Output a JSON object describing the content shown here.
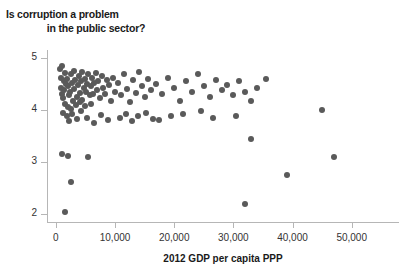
{
  "chart_data": {
    "type": "scatter",
    "title": "Is corruption a problem in the public sector?",
    "title_line1": "Is corruption a problem",
    "title_line2": "in the public sector?",
    "xlabel": "2012 GDP per capita PPP",
    "ylabel": "",
    "xlim": [
      -1500,
      58000
    ],
    "ylim": [
      1.85,
      5.15
    ],
    "xticks": [
      0,
      10000,
      20000,
      30000,
      40000,
      50000
    ],
    "xtick_labels": [
      "0",
      "10,000",
      "20,000",
      "30,000",
      "40,000",
      "50,000"
    ],
    "yticks": [
      2,
      3,
      4,
      5
    ],
    "ytick_labels": [
      "2",
      "3",
      "4",
      "5"
    ],
    "grid": false,
    "legend": false,
    "marker_color": "#5a5a5a",
    "axis_color": "#b6b6b6",
    "marker_size": 6,
    "points": [
      [
        700,
        4.78
      ],
      [
        900,
        4.62
      ],
      [
        1100,
        4.85
      ],
      [
        1300,
        4.55
      ],
      [
        800,
        4.42
      ],
      [
        1000,
        4.3
      ],
      [
        1200,
        4.22
      ],
      [
        1500,
        4.7
      ],
      [
        1700,
        4.5
      ],
      [
        1400,
        4.38
      ],
      [
        1600,
        4.12
      ],
      [
        1900,
        4.6
      ],
      [
        2100,
        4.45
      ],
      [
        2300,
        4.28
      ],
      [
        2000,
        4.05
      ],
      [
        2500,
        4.68
      ],
      [
        2700,
        4.52
      ],
      [
        2400,
        4.35
      ],
      [
        2900,
        4.18
      ],
      [
        2600,
        4.02
      ],
      [
        3100,
        4.75
      ],
      [
        3300,
        4.58
      ],
      [
        3000,
        4.4
      ],
      [
        3500,
        4.25
      ],
      [
        3700,
        4.48
      ],
      [
        3400,
        4.1
      ],
      [
        3900,
        4.65
      ],
      [
        4100,
        4.32
      ],
      [
        4300,
        4.55
      ],
      [
        4000,
        4.15
      ],
      [
        4500,
        4.72
      ],
      [
        4700,
        4.42
      ],
      [
        4400,
        4.2
      ],
      [
        4900,
        4.6
      ],
      [
        5100,
        4.35
      ],
      [
        5300,
        4.5
      ],
      [
        5000,
        4.08
      ],
      [
        5500,
        4.68
      ],
      [
        5700,
        4.28
      ],
      [
        5900,
        4.45
      ],
      [
        6100,
        4.62
      ],
      [
        6300,
        4.3
      ],
      [
        6500,
        4.52
      ],
      [
        6000,
        4.12
      ],
      [
        6800,
        4.7
      ],
      [
        7000,
        4.38
      ],
      [
        7200,
        4.55
      ],
      [
        7500,
        4.22
      ],
      [
        7800,
        4.65
      ],
      [
        8000,
        4.42
      ],
      [
        8300,
        4.3
      ],
      [
        8600,
        4.58
      ],
      [
        9000,
        4.48
      ],
      [
        9300,
        4.18
      ],
      [
        9600,
        4.62
      ],
      [
        10000,
        4.35
      ],
      [
        1200,
        3.95
      ],
      [
        1800,
        3.88
      ],
      [
        2200,
        3.78
      ],
      [
        2800,
        3.92
      ],
      [
        3600,
        3.82
      ],
      [
        4200,
        3.98
      ],
      [
        5200,
        3.85
      ],
      [
        6400,
        3.75
      ],
      [
        7600,
        3.9
      ],
      [
        8800,
        3.8
      ],
      [
        1100,
        3.15
      ],
      [
        2000,
        3.12
      ],
      [
        5500,
        3.1
      ],
      [
        2500,
        2.62
      ],
      [
        1500,
        2.05
      ],
      [
        10500,
        4.52
      ],
      [
        11000,
        4.28
      ],
      [
        11500,
        4.68
      ],
      [
        12000,
        4.4
      ],
      [
        12500,
        4.15
      ],
      [
        13000,
        4.58
      ],
      [
        13500,
        4.32
      ],
      [
        14000,
        4.72
      ],
      [
        14500,
        4.45
      ],
      [
        15000,
        4.25
      ],
      [
        15500,
        4.6
      ],
      [
        16000,
        4.38
      ],
      [
        10800,
        3.85
      ],
      [
        11800,
        3.92
      ],
      [
        12800,
        3.78
      ],
      [
        13800,
        3.88
      ],
      [
        15200,
        3.95
      ],
      [
        16500,
        3.82
      ],
      [
        17000,
        4.5
      ],
      [
        18000,
        4.3
      ],
      [
        19000,
        4.62
      ],
      [
        20000,
        4.42
      ],
      [
        21000,
        4.18
      ],
      [
        22000,
        4.55
      ],
      [
        23000,
        4.35
      ],
      [
        24000,
        4.68
      ],
      [
        25000,
        4.45
      ],
      [
        26000,
        4.25
      ],
      [
        27000,
        4.58
      ],
      [
        28000,
        4.38
      ],
      [
        17500,
        3.8
      ],
      [
        19500,
        3.88
      ],
      [
        21500,
        3.92
      ],
      [
        24500,
        3.98
      ],
      [
        26500,
        3.85
      ],
      [
        29000,
        4.48
      ],
      [
        30000,
        4.28
      ],
      [
        31000,
        4.55
      ],
      [
        32000,
        4.35
      ],
      [
        33000,
        4.18
      ],
      [
        34000,
        4.42
      ],
      [
        35500,
        4.6
      ],
      [
        30500,
        3.88
      ],
      [
        33000,
        3.45
      ],
      [
        39000,
        2.75
      ],
      [
        32000,
        2.2
      ],
      [
        45000,
        4.0
      ],
      [
        47000,
        3.1
      ]
    ]
  }
}
